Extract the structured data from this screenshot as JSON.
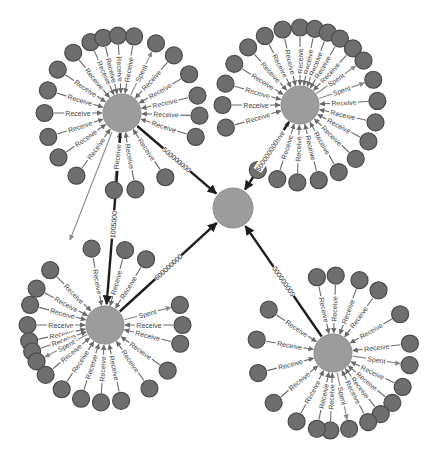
{
  "diagram": {
    "type": "transaction-graph",
    "colors": {
      "background": "#ffffff",
      "leaf_fill": "#6e6e6e",
      "leaf_stroke": "#4a4a4a",
      "hub_fill": "#9c9c9c",
      "thin_edge": "#6a6a6a",
      "spent_edge": "#8a8a8a",
      "thick_edge": "#1e1e1e"
    },
    "edge_label_receive": "Receive",
    "edge_label_spent": "Spent",
    "center": {
      "id": "center",
      "x": 233,
      "y": 208,
      "r": 20
    },
    "hubs": [
      {
        "id": "hub-top-left",
        "x": 122,
        "y": 113,
        "r": 19,
        "to_center_label": "500000000",
        "leaves": [
          {
            "a": 180,
            "label": "Receive"
          },
          {
            "a": 197,
            "label": "Receive"
          },
          {
            "a": 214,
            "label": "Receive"
          },
          {
            "a": 231,
            "label": "Receive"
          },
          {
            "a": 246,
            "label": "Receive"
          },
          {
            "a": 256,
            "label": "Receive"
          },
          {
            "a": 267,
            "label": "Receive"
          },
          {
            "a": 279,
            "label": "Receive"
          },
          {
            "a": 296,
            "label": "Spent",
            "out": true
          },
          {
            "a": 312,
            "label": "Receive"
          },
          {
            "a": 330,
            "label": "Receive"
          },
          {
            "a": 347,
            "label": "Receive"
          },
          {
            "a": 2,
            "label": "Receive"
          },
          {
            "a": 18,
            "label": "Receive"
          },
          {
            "a": 56,
            "label": "Receive"
          },
          {
            "a": 80,
            "label": "Receive"
          },
          {
            "a": 96,
            "label": "Receive"
          },
          {
            "a": 126,
            "label": "Receive"
          },
          {
            "a": 145,
            "label": "Receive"
          },
          {
            "a": 162,
            "label": "Receive"
          }
        ]
      },
      {
        "id": "hub-top-right",
        "x": 300,
        "y": 105,
        "r": 19,
        "to_center_label": "500000000",
        "leaves": [
          {
            "a": 180,
            "label": "Receive"
          },
          {
            "a": 196,
            "label": "Receive"
          },
          {
            "a": 212,
            "label": "Receive"
          },
          {
            "a": 228,
            "label": "Receive"
          },
          {
            "a": 243,
            "label": "Receive"
          },
          {
            "a": 257,
            "label": "Receive"
          },
          {
            "a": 270,
            "label": "Receive"
          },
          {
            "a": 281,
            "label": "Receive"
          },
          {
            "a": 291,
            "label": "Receive"
          },
          {
            "a": 301,
            "label": "Receive"
          },
          {
            "a": 313,
            "label": "Receive"
          },
          {
            "a": 325,
            "label": "Spent",
            "out": true
          },
          {
            "a": 341,
            "label": "Spent",
            "out": true
          },
          {
            "a": 357,
            "label": "Receive"
          },
          {
            "a": 13,
            "label": "Receive"
          },
          {
            "a": 28,
            "label": "Receive"
          },
          {
            "a": 44,
            "label": "Receive"
          },
          {
            "a": 60,
            "label": "Receive"
          },
          {
            "a": 76,
            "label": "Receive"
          },
          {
            "a": 92,
            "label": "Receive"
          },
          {
            "a": 107,
            "label": "Receive"
          },
          {
            "a": 123,
            "label": "Receive"
          },
          {
            "a": 163,
            "label": "Receive"
          }
        ]
      },
      {
        "id": "hub-bottom-left",
        "x": 105,
        "y": 325,
        "r": 19,
        "to_center_label": "600000000",
        "from_top_left_label": "1005000",
        "leaves": [
          {
            "a": 180,
            "label": "Receive"
          },
          {
            "a": 168,
            "label": "Receive"
          },
          {
            "a": 160,
            "label": "Receive"
          },
          {
            "a": 152,
            "label": "Spent",
            "out": true
          },
          {
            "a": 140,
            "label": "Receive"
          },
          {
            "a": 124,
            "label": "Receive"
          },
          {
            "a": 108,
            "label": "Receive"
          },
          {
            "a": 93,
            "label": "Receive"
          },
          {
            "a": 78,
            "label": "Receive"
          },
          {
            "a": 55,
            "label": "Receive"
          },
          {
            "a": 36,
            "label": "Receive"
          },
          {
            "a": 14,
            "label": "Receive"
          },
          {
            "a": 0,
            "label": "Receive"
          },
          {
            "a": 345,
            "label": "Spent",
            "out": true
          },
          {
            "a": 302,
            "label": "Receive"
          },
          {
            "a": 285,
            "label": "Receive"
          },
          {
            "a": 260,
            "label": "Receive"
          },
          {
            "a": 225,
            "label": "Receive"
          },
          {
            "a": 208,
            "label": "Receive"
          },
          {
            "a": 195,
            "label": "Receive"
          }
        ]
      },
      {
        "id": "hub-bottom-right",
        "x": 333,
        "y": 353,
        "r": 19,
        "to_center_label": "500000000",
        "leaves": [
          {
            "a": 190,
            "label": "Receive"
          },
          {
            "a": 214,
            "label": "Receive"
          },
          {
            "a": 258,
            "label": "Receive"
          },
          {
            "a": 272,
            "label": "Receive"
          },
          {
            "a": 290,
            "label": "Receive"
          },
          {
            "a": 306,
            "label": "Receive"
          },
          {
            "a": 330,
            "label": "Receive"
          },
          {
            "a": 353,
            "label": "Receive"
          },
          {
            "a": 9,
            "label": "Spent",
            "out": true
          },
          {
            "a": 26,
            "label": "Receive"
          },
          {
            "a": 40,
            "label": "Receive"
          },
          {
            "a": 52,
            "label": "Receive"
          },
          {
            "a": 63,
            "label": "Receive"
          },
          {
            "a": 78,
            "label": "Spent",
            "out": true
          },
          {
            "a": 92,
            "label": "Receive"
          },
          {
            "a": 102,
            "label": "Receive"
          },
          {
            "a": 118,
            "label": "Receive"
          },
          {
            "a": 140,
            "label": "Receive"
          },
          {
            "a": 165,
            "label": "Receive"
          }
        ]
      }
    ],
    "leaf_radius": 8.5,
    "spoke_length": 50,
    "cross_edges": [
      {
        "from": "hub-top-left",
        "to": "leaf-bl",
        "label": "Spent",
        "x1": 112,
        "y1": 132,
        "x2": 70,
        "y2": 240
      }
    ]
  }
}
